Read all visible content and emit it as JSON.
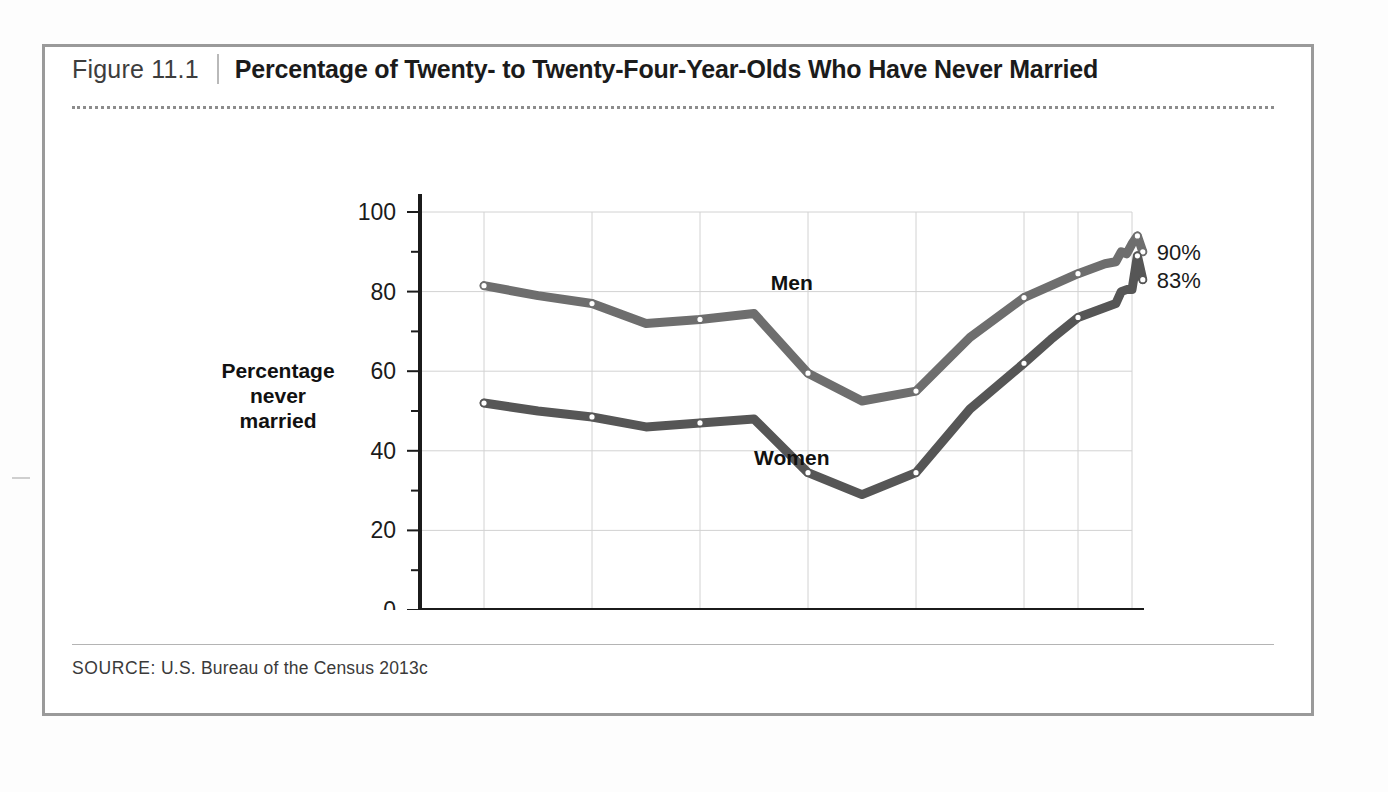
{
  "figure": {
    "number": "Figure 11.1",
    "title": "Percentage of Twenty- to Twenty-Four-Year-Olds Who Have Never Married",
    "source_label": "SOURCE:",
    "source_text": " U.S. Bureau of the Census 2013c"
  },
  "axis": {
    "y_title_line1": "Percentage",
    "y_title_line2": "never",
    "y_title_line3": "married"
  },
  "labels": {
    "men": "Men",
    "women": "Women",
    "men_end": "90%",
    "women_end": "83%"
  },
  "colors": {
    "men_line": "#6e6e6e",
    "women_line": "#565656",
    "grid": "#d2d2d2",
    "axis": "#1b1b1b",
    "frame": "#9a9a9a"
  },
  "chart_data": {
    "type": "line",
    "title": "Percentage of Twenty- to Twenty-Four-Year-Olds Who Have Never Married",
    "xlabel": "",
    "ylabel": "Percentage never married",
    "ylim": [
      0,
      100
    ],
    "yticks": [
      0,
      20,
      40,
      60,
      80,
      100
    ],
    "ytick_labels": [
      "0",
      "20",
      "40",
      "60",
      "80",
      "100"
    ],
    "y_minor_ticks": [
      10,
      30,
      50,
      70,
      90
    ],
    "xticks": [
      1890,
      1910,
      1930,
      1950,
      1970,
      1990,
      2000,
      2010
    ],
    "xtick_labels": [
      "1890",
      "1910",
      "1930",
      "1950",
      "1970",
      "1990",
      "2000",
      "2010"
    ],
    "xlim": [
      1890,
      2013
    ],
    "grid": true,
    "legend_position": "inline-labels",
    "x": [
      1890,
      1900,
      1910,
      1920,
      1930,
      1940,
      1950,
      1960,
      1970,
      1980,
      1990,
      1995,
      2000,
      2005,
      2007,
      2008,
      2009,
      2010,
      2011,
      2012
    ],
    "series": [
      {
        "name": "Men",
        "values": [
          81.5,
          79.0,
          77.0,
          72.0,
          73.0,
          74.5,
          59.5,
          52.5,
          55.0,
          68.5,
          78.5,
          81.5,
          84.5,
          87.0,
          87.5,
          90.0,
          89.5,
          92.0,
          94.0,
          90.0
        ],
        "marker_years": [
          1890,
          1910,
          1930,
          1950,
          1970,
          1990,
          2000,
          2011,
          2012
        ],
        "end_label": "90%",
        "color": "#6e6e6e"
      },
      {
        "name": "Women",
        "values": [
          52.0,
          50.0,
          48.5,
          46.0,
          47.0,
          48.0,
          34.5,
          29.0,
          34.5,
          50.5,
          62.0,
          68.0,
          73.5,
          76.0,
          77.0,
          80.0,
          80.5,
          80.5,
          89.0,
          83.0
        ],
        "marker_years": [
          1890,
          1910,
          1930,
          1950,
          1970,
          1990,
          2000,
          2011,
          2012
        ],
        "end_label": "83%",
        "color": "#565656"
      }
    ],
    "annotations": [
      {
        "text": "Men",
        "x": 1947,
        "y": 80.5
      },
      {
        "text": "Women",
        "x": 1947,
        "y": 36.5
      }
    ]
  }
}
